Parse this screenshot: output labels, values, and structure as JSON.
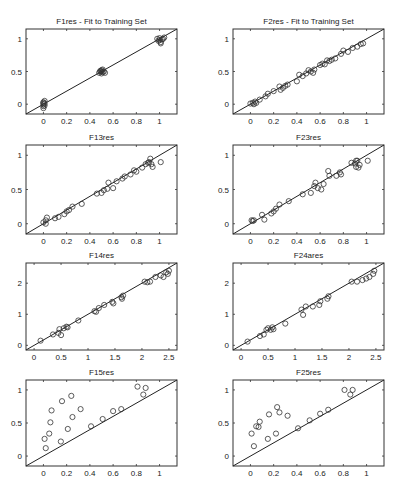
{
  "chart_data": [
    {
      "type": "scatter",
      "title": "F1res - Fit to Training Set",
      "xlim": [
        -0.15,
        1.15
      ],
      "ylim": [
        -0.15,
        1.15
      ],
      "xticks": [
        0,
        0.2,
        0.4,
        0.6,
        0.8,
        1
      ],
      "xtick_labels": [
        "0",
        "0.2",
        "0.4",
        "0.6",
        "0.8",
        "1"
      ],
      "yticks": [
        0,
        0.5,
        1
      ],
      "ytick_labels": [
        "0",
        "0.5",
        "1"
      ],
      "reference_line": "y = x",
      "box": [
        26,
        29,
        177,
        114
      ],
      "points": [
        [
          0,
          0
        ],
        [
          0,
          0.02
        ],
        [
          0,
          -0.03
        ],
        [
          0.01,
          0.05
        ],
        [
          0,
          -0.06
        ],
        [
          0.01,
          0.01
        ],
        [
          0,
          0.03
        ],
        [
          0.01,
          -0.02
        ],
        [
          0.48,
          0.48
        ],
        [
          0.49,
          0.5
        ],
        [
          0.5,
          0.47
        ],
        [
          0.5,
          0.52
        ],
        [
          0.51,
          0.49
        ],
        [
          0.52,
          0.5
        ],
        [
          0.5,
          0.5
        ],
        [
          0.53,
          0.48
        ],
        [
          0.49,
          0.51
        ],
        [
          0.51,
          0.53
        ],
        [
          0.98,
          1.0
        ],
        [
          0.99,
          0.97
        ],
        [
          1.0,
          0.98
        ],
        [
          1.01,
          0.95
        ],
        [
          1.0,
          1.01
        ],
        [
          1.02,
          0.99
        ],
        [
          1.03,
          1.0
        ],
        [
          1.01,
          0.93
        ],
        [
          1.04,
          1.02
        ]
      ]
    },
    {
      "type": "scatter",
      "title": "F2res - Fit to Training Set",
      "xlim": [
        -0.15,
        1.15
      ],
      "ylim": [
        -0.15,
        1.15
      ],
      "xticks": [
        0,
        0.2,
        0.4,
        0.6,
        0.8,
        1
      ],
      "xtick_labels": [
        "0",
        "0.2",
        "0.4",
        "0.6",
        "0.8",
        "1"
      ],
      "yticks": [
        0,
        0.5,
        1
      ],
      "ytick_labels": [
        "0",
        "0.5",
        "1"
      ],
      "reference_line": "y = x",
      "box": [
        233,
        29,
        384,
        114
      ],
      "points": [
        [
          0,
          0.01
        ],
        [
          0.02,
          0.02
        ],
        [
          0.03,
          0
        ],
        [
          0.04,
          0.04
        ],
        [
          0.05,
          0.02
        ],
        [
          0.08,
          0.07
        ],
        [
          0.13,
          0.12
        ],
        [
          0.15,
          0.16
        ],
        [
          0.2,
          0.2
        ],
        [
          0.25,
          0.27
        ],
        [
          0.26,
          0.22
        ],
        [
          0.28,
          0.25
        ],
        [
          0.3,
          0.28
        ],
        [
          0.32,
          0.3
        ],
        [
          0.4,
          0.35
        ],
        [
          0.42,
          0.45
        ],
        [
          0.45,
          0.43
        ],
        [
          0.48,
          0.47
        ],
        [
          0.5,
          0.52
        ],
        [
          0.52,
          0.5
        ],
        [
          0.54,
          0.48
        ],
        [
          0.55,
          0.53
        ],
        [
          0.6,
          0.6
        ],
        [
          0.62,
          0.62
        ],
        [
          0.64,
          0.61
        ],
        [
          0.66,
          0.67
        ],
        [
          0.68,
          0.66
        ],
        [
          0.7,
          0.68
        ],
        [
          0.73,
          0.7
        ],
        [
          0.78,
          0.77
        ],
        [
          0.8,
          0.82
        ],
        [
          0.84,
          0.8
        ],
        [
          0.88,
          0.86
        ],
        [
          0.92,
          0.88
        ],
        [
          0.95,
          0.92
        ],
        [
          0.97,
          0.93
        ]
      ]
    },
    {
      "type": "scatter",
      "title": "F13res",
      "xlim": [
        -0.15,
        1.15
      ],
      "ylim": [
        -0.15,
        1.15
      ],
      "xticks": [
        0,
        0.2,
        0.4,
        0.6,
        0.8,
        1
      ],
      "xtick_labels": [
        "0",
        "0.2",
        "0.4",
        "0.6",
        "0.8",
        "1"
      ],
      "yticks": [
        0,
        0.5,
        1
      ],
      "ytick_labels": [
        "0",
        "0.5",
        "1"
      ],
      "reference_line": "y = x",
      "box": [
        26,
        145,
        177,
        234
      ],
      "points": [
        [
          0,
          0.02
        ],
        [
          0.02,
          0.05
        ],
        [
          0.03,
          0.09
        ],
        [
          0.02,
          0.0
        ],
        [
          0.1,
          0.08
        ],
        [
          0.13,
          0.1
        ],
        [
          0.18,
          0.14
        ],
        [
          0.2,
          0.18
        ],
        [
          0.22,
          0.2
        ],
        [
          0.25,
          0.25
        ],
        [
          0.33,
          0.29
        ],
        [
          0.46,
          0.44
        ],
        [
          0.5,
          0.45
        ],
        [
          0.52,
          0.49
        ],
        [
          0.55,
          0.51
        ],
        [
          0.56,
          0.6
        ],
        [
          0.6,
          0.52
        ],
        [
          0.63,
          0.62
        ],
        [
          0.68,
          0.66
        ],
        [
          0.7,
          0.69
        ],
        [
          0.75,
          0.72
        ],
        [
          0.78,
          0.78
        ],
        [
          0.8,
          0.76
        ],
        [
          0.85,
          0.82
        ],
        [
          0.88,
          0.87
        ],
        [
          0.9,
          0.89
        ],
        [
          0.91,
          0.9
        ],
        [
          0.92,
          0.95
        ],
        [
          0.93,
          0.87
        ],
        [
          0.94,
          0.83
        ],
        [
          1.01,
          0.9
        ]
      ]
    },
    {
      "type": "scatter",
      "title": "F23res",
      "xlim": [
        -0.15,
        1.15
      ],
      "ylim": [
        -0.15,
        1.15
      ],
      "xticks": [
        0,
        0.2,
        0.4,
        0.6,
        0.8,
        1
      ],
      "xtick_labels": [
        "0",
        "0.2",
        "0.4",
        "0.6",
        "0.8",
        "1"
      ],
      "yticks": [
        0,
        0.5,
        1
      ],
      "ytick_labels": [
        "0",
        "0.5",
        "1"
      ],
      "reference_line": "y = x",
      "box": [
        233,
        145,
        384,
        234
      ],
      "points": [
        [
          0.01,
          0.05
        ],
        [
          0.02,
          0.04
        ],
        [
          0.03,
          0.05
        ],
        [
          0.1,
          0.13
        ],
        [
          0.12,
          0.06
        ],
        [
          0.18,
          0.15
        ],
        [
          0.2,
          0.18
        ],
        [
          0.22,
          0.22
        ],
        [
          0.25,
          0.28
        ],
        [
          0.33,
          0.33
        ],
        [
          0.45,
          0.43
        ],
        [
          0.52,
          0.45
        ],
        [
          0.55,
          0.55
        ],
        [
          0.56,
          0.6
        ],
        [
          0.58,
          0.52
        ],
        [
          0.61,
          0.5
        ],
        [
          0.63,
          0.58
        ],
        [
          0.67,
          0.77
        ],
        [
          0.68,
          0.7
        ],
        [
          0.74,
          0.7
        ],
        [
          0.77,
          0.75
        ],
        [
          0.78,
          0.72
        ],
        [
          0.87,
          0.89
        ],
        [
          0.9,
          0.88
        ],
        [
          0.91,
          0.92
        ],
        [
          0.92,
          0.92
        ],
        [
          0.91,
          0.83
        ],
        [
          0.93,
          0.82
        ],
        [
          0.94,
          0.86
        ],
        [
          1.01,
          0.92
        ]
      ]
    },
    {
      "type": "scatter",
      "title": "F14res",
      "xlim": [
        -0.15,
        2.65
      ],
      "ylim": [
        -0.15,
        2.65
      ],
      "xticks": [
        0,
        0.5,
        1,
        1.5,
        2,
        2.5
      ],
      "xtick_labels": [
        "0",
        "0.5",
        "1",
        "1.5",
        "2",
        "2.5"
      ],
      "yticks": [
        0,
        1,
        2
      ],
      "ytick_labels": [
        "0",
        "1",
        "2"
      ],
      "reference_line": "y = x",
      "box": [
        26,
        263,
        177,
        350
      ],
      "points": [
        [
          0.12,
          0.15
        ],
        [
          0.35,
          0.35
        ],
        [
          0.45,
          0.4
        ],
        [
          0.47,
          0.52
        ],
        [
          0.5,
          0.33
        ],
        [
          0.55,
          0.55
        ],
        [
          0.6,
          0.6
        ],
        [
          0.62,
          0.58
        ],
        [
          0.82,
          0.8
        ],
        [
          1.12,
          1.1
        ],
        [
          1.15,
          1.08
        ],
        [
          1.2,
          1.2
        ],
        [
          1.3,
          1.3
        ],
        [
          1.45,
          1.4
        ],
        [
          1.47,
          1.35
        ],
        [
          1.62,
          1.55
        ],
        [
          1.63,
          1.5
        ],
        [
          1.65,
          1.6
        ],
        [
          2.05,
          2.05
        ],
        [
          2.1,
          2.03
        ],
        [
          2.15,
          2.05
        ],
        [
          2.25,
          2.2
        ],
        [
          2.35,
          2.25
        ],
        [
          2.4,
          2.2
        ],
        [
          2.45,
          2.35
        ],
        [
          2.48,
          2.3
        ],
        [
          2.5,
          2.4
        ]
      ]
    },
    {
      "type": "scatter",
      "title": "F24ares",
      "xlim": [
        -0.15,
        2.65
      ],
      "ylim": [
        -0.15,
        2.65
      ],
      "xticks": [
        0,
        0.5,
        1,
        1.5,
        2,
        2.5
      ],
      "xtick_labels": [
        "0",
        "0.5",
        "1",
        "1.5",
        "2",
        "2.5"
      ],
      "yticks": [
        0,
        1,
        2
      ],
      "ytick_labels": [
        "0",
        "1",
        "2"
      ],
      "reference_line": "y = x",
      "box": [
        233,
        263,
        384,
        350
      ],
      "points": [
        [
          0.12,
          0.12
        ],
        [
          0.35,
          0.3
        ],
        [
          0.42,
          0.35
        ],
        [
          0.47,
          0.5
        ],
        [
          0.5,
          0.55
        ],
        [
          0.55,
          0.5
        ],
        [
          0.58,
          0.58
        ],
        [
          0.6,
          0.52
        ],
        [
          0.82,
          0.7
        ],
        [
          1.12,
          1.15
        ],
        [
          1.15,
          0.98
        ],
        [
          1.2,
          1.25
        ],
        [
          1.33,
          1.25
        ],
        [
          1.45,
          1.3
        ],
        [
          1.47,
          1.42
        ],
        [
          1.6,
          1.5
        ],
        [
          1.62,
          1.58
        ],
        [
          2.05,
          2.05
        ],
        [
          2.15,
          2.05
        ],
        [
          2.25,
          2.1
        ],
        [
          2.32,
          2.15
        ],
        [
          2.38,
          2.2
        ],
        [
          2.45,
          2.3
        ],
        [
          2.47,
          2.4
        ]
      ]
    },
    {
      "type": "scatter",
      "title": "F15res",
      "xlim": [
        -0.15,
        1.15
      ],
      "ylim": [
        -0.15,
        1.15
      ],
      "xticks": [
        0,
        0.2,
        0.4,
        0.6,
        0.8,
        1
      ],
      "xtick_labels": [
        "0",
        "0.2",
        "0.4",
        "0.6",
        "0.8",
        "1"
      ],
      "yticks": [
        0,
        0.5,
        1
      ],
      "ytick_labels": [
        "0",
        "0.5",
        "1"
      ],
      "reference_line": "y = x",
      "box": [
        26,
        380,
        177,
        466
      ],
      "points": [
        [
          0.01,
          0.26
        ],
        [
          0.02,
          0.12
        ],
        [
          0.05,
          0.34
        ],
        [
          0.06,
          0.51
        ],
        [
          0.07,
          0.69
        ],
        [
          0.15,
          0.22
        ],
        [
          0.16,
          0.83
        ],
        [
          0.21,
          0.41
        ],
        [
          0.24,
          0.91
        ],
        [
          0.25,
          0.59
        ],
        [
          0.32,
          0.71
        ],
        [
          0.41,
          0.45
        ],
        [
          0.51,
          0.56
        ],
        [
          0.6,
          0.68
        ],
        [
          0.67,
          0.71
        ],
        [
          0.81,
          1.05
        ],
        [
          0.86,
          0.93
        ],
        [
          0.88,
          1.03
        ]
      ]
    },
    {
      "type": "scatter",
      "title": "F25res",
      "xlim": [
        -0.15,
        1.15
      ],
      "ylim": [
        -0.15,
        1.15
      ],
      "xticks": [
        0,
        0.2,
        0.4,
        0.6,
        0.8,
        1
      ],
      "xtick_labels": [
        "0",
        "0.2",
        "0.4",
        "0.6",
        "0.8",
        "1"
      ],
      "yticks": [
        0,
        0.5,
        1
      ],
      "ytick_labels": [
        "0",
        "0.5",
        "1"
      ],
      "reference_line": "y = x",
      "box": [
        233,
        380,
        384,
        466
      ],
      "points": [
        [
          0.01,
          0.34
        ],
        [
          0.03,
          0.15
        ],
        [
          0.05,
          0.45
        ],
        [
          0.07,
          0.44
        ],
        [
          0.08,
          0.52
        ],
        [
          0.15,
          0.26
        ],
        [
          0.16,
          0.63
        ],
        [
          0.22,
          0.34
        ],
        [
          0.23,
          0.74
        ],
        [
          0.25,
          0.66
        ],
        [
          0.32,
          0.61
        ],
        [
          0.41,
          0.42
        ],
        [
          0.51,
          0.54
        ],
        [
          0.6,
          0.64
        ],
        [
          0.67,
          0.7
        ],
        [
          0.81,
          1.0
        ],
        [
          0.86,
          0.93
        ],
        [
          0.88,
          1.0
        ]
      ]
    }
  ]
}
